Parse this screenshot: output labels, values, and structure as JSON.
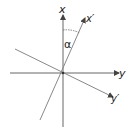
{
  "diagram": {
    "labels": {
      "x": "x",
      "x_prime": "x′",
      "y": "y",
      "y_prime": "y′",
      "angle": "α"
    },
    "colors": {
      "axis": "#555555",
      "rotated_axis": "#777777",
      "text": "#222222",
      "background": "#ffffff"
    }
  }
}
